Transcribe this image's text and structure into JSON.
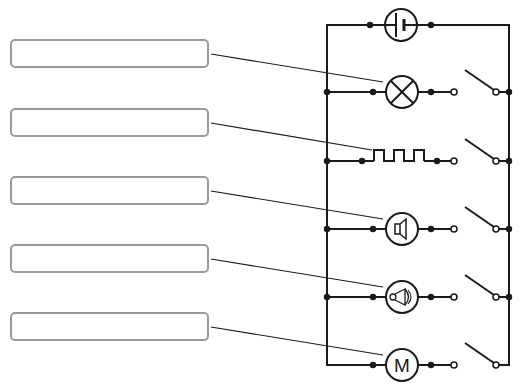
{
  "diagram": {
    "title": "",
    "type": "parallel circuit with switches",
    "colors": {
      "wire": "#1a1a1a",
      "box_border": "#9a9a9a",
      "leader": "#1a1a1a"
    },
    "label_boxes": [
      {
        "id": 1,
        "text": "",
        "target": "lamp"
      },
      {
        "id": 2,
        "text": "",
        "target": "heater"
      },
      {
        "id": 3,
        "text": "",
        "target": "loudspeaker"
      },
      {
        "id": 4,
        "text": "",
        "target": "bell"
      },
      {
        "id": 5,
        "text": "",
        "target": "motor"
      }
    ],
    "power_source": {
      "symbol": "battery-cell-icon"
    },
    "branches": [
      {
        "component": "lamp",
        "symbol": "lamp-icon",
        "switch": "open"
      },
      {
        "component": "heater",
        "symbol": "heating-element-icon",
        "switch": "open"
      },
      {
        "component": "loudspeaker",
        "symbol": "loudspeaker-icon",
        "switch": "open"
      },
      {
        "component": "bell",
        "symbol": "bell-icon",
        "switch": "open"
      },
      {
        "component": "motor",
        "symbol": "motor-icon",
        "letter": "M",
        "switch": "open"
      }
    ]
  }
}
